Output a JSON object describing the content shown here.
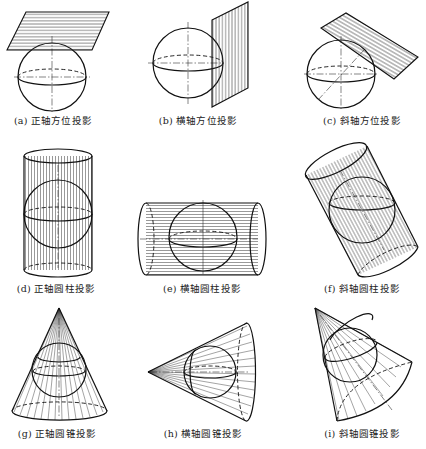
{
  "figure": {
    "panels": [
      {
        "id": "a",
        "label": "(a) 正轴方位投影",
        "surface": "plane",
        "aspect": "normal"
      },
      {
        "id": "b",
        "label": "(b) 横轴方位投影",
        "surface": "plane",
        "aspect": "transverse"
      },
      {
        "id": "c",
        "label": "(c) 斜轴方位投影",
        "surface": "plane",
        "aspect": "oblique"
      },
      {
        "id": "d",
        "label": "(d) 正轴圆柱投影",
        "surface": "cylinder",
        "aspect": "normal"
      },
      {
        "id": "e",
        "label": "(e) 横轴圆柱投影",
        "surface": "cylinder",
        "aspect": "transverse"
      },
      {
        "id": "f",
        "label": "(f) 斜轴圆柱投影",
        "surface": "cylinder",
        "aspect": "oblique"
      },
      {
        "id": "g",
        "label": "(g) 正轴圆锥投影",
        "surface": "cone",
        "aspect": "normal"
      },
      {
        "id": "h",
        "label": "(h) 横轴圆锥投影",
        "surface": "cone",
        "aspect": "transverse"
      },
      {
        "id": "i",
        "label": "(i) 斜轴圆锥投影",
        "surface": "cone",
        "aspect": "oblique"
      }
    ],
    "colors": {
      "line": "#111111",
      "background": "#ffffff"
    }
  }
}
